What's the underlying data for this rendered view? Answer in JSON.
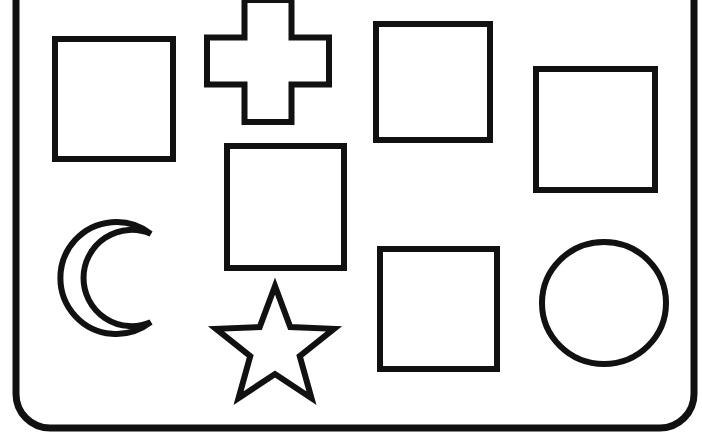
{
  "page": {
    "background_color": "#ffffff",
    "ink_color": "#111111",
    "width": 702,
    "height": 432
  },
  "frame": {
    "name": "rounded-rectangle-border",
    "label": "Worksheet Border",
    "stroke_color": "#111111",
    "stroke_width": 7,
    "corner_radius": 34,
    "left": 16,
    "right": 694,
    "bottom": 428,
    "top_cropped": true
  },
  "shapes": [
    {
      "id": "square-1",
      "label": "Square",
      "kind": "square",
      "x": 55,
      "y": 39,
      "width": 118,
      "height": 120,
      "stroke_width": 6
    },
    {
      "id": "cross-1",
      "label": "Cross",
      "kind": "cross",
      "x": 207,
      "y": 0,
      "width": 122,
      "height": 122,
      "arm_thickness": 47,
      "stroke_width": 6
    },
    {
      "id": "square-2",
      "label": "Square",
      "kind": "square",
      "x": 376,
      "y": 24,
      "width": 114,
      "height": 116,
      "stroke_width": 6
    },
    {
      "id": "square-3",
      "label": "Square",
      "kind": "square",
      "x": 536,
      "y": 69,
      "width": 119,
      "height": 121,
      "stroke_width": 6
    },
    {
      "id": "square-4",
      "label": "Square",
      "kind": "square",
      "x": 227,
      "y": 146,
      "width": 117,
      "height": 122,
      "stroke_width": 6
    },
    {
      "id": "crescent-1",
      "label": "Crescent Moon",
      "kind": "crescent",
      "center_x": 116,
      "center_y": 278,
      "radius": 56,
      "stroke_width": 6
    },
    {
      "id": "square-5",
      "label": "Square",
      "kind": "square",
      "x": 380,
      "y": 249,
      "width": 117,
      "height": 120,
      "stroke_width": 6
    },
    {
      "id": "circle-1",
      "label": "Circle",
      "kind": "circle",
      "center_x": 604,
      "center_y": 303,
      "radius_x": 62,
      "radius_y": 61,
      "stroke_width": 6
    },
    {
      "id": "star-1",
      "label": "Five Pointed Star",
      "kind": "star",
      "center_x": 275,
      "center_y": 348,
      "outer_radius": 62,
      "inner_radius": 26,
      "points": 5,
      "stroke_width": 6
    }
  ]
}
